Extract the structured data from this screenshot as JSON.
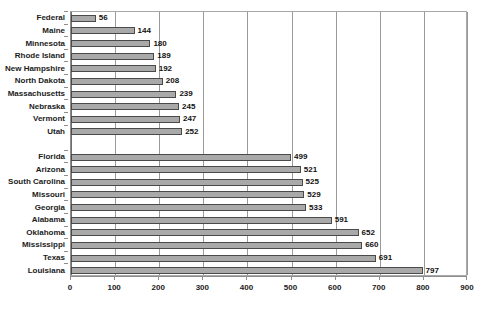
{
  "chart_data": {
    "type": "bar",
    "orientation": "horizontal",
    "title": "Rate Per 100,000 People",
    "xlabel": "",
    "ylabel": "",
    "xlim": [
      0,
      900
    ],
    "xticks": [
      0,
      100,
      200,
      300,
      400,
      500,
      600,
      700,
      800,
      900
    ],
    "grid": true,
    "legend": false,
    "bar_color": "#a9a9a9",
    "bar_border_color": "#4a4a4a",
    "categories": [
      "Federal",
      "Maine",
      "Minnesota",
      "Rhode Island",
      "New Hampshire",
      "North Dakota",
      "Massachusetts",
      "Nebraska",
      "Vermont",
      "Utah",
      "Florida",
      "Arizona",
      "South Carolina",
      "Missouri",
      "Georgia",
      "Alabama",
      "Oklahoma",
      "Mississippi",
      "Texas",
      "Louisiana"
    ],
    "values": [
      56,
      144,
      180,
      189,
      192,
      208,
      239,
      245,
      247,
      252,
      499,
      521,
      525,
      529,
      533,
      591,
      652,
      660,
      691,
      797
    ],
    "group_break_after_index": 9
  }
}
